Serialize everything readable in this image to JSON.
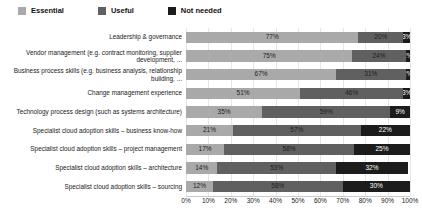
{
  "legend": {
    "items": [
      {
        "label": "Essential",
        "color": "#a9a9a9"
      },
      {
        "label": "Useful",
        "color": "#606060"
      },
      {
        "label": "Not needed",
        "color": "#1c1c1c"
      }
    ]
  },
  "axis": {
    "x_ticks": [
      "0%",
      "10%",
      "20%",
      "30%",
      "40%",
      "50%",
      "60%",
      "70%",
      "80%",
      "90%",
      "100%"
    ]
  },
  "chart_data": {
    "type": "bar",
    "orientation": "horizontal",
    "stacked": true,
    "stack_mode": "percent",
    "title": "",
    "xlabel": "",
    "ylabel": "",
    "xlim": [
      0,
      100
    ],
    "grid": true,
    "legend_position": "top-left",
    "categories": [
      "Leadership & governance",
      "Vendor management (e.g. contract monitoring, supplier development, ...",
      "Business process skills (e.g. business analysis, relationship building, ...",
      "Change management experience",
      "Technology process design (such as systems architecture)",
      "Specialist cloud adoption skills – business know-how",
      "Specialist cloud adoption skills – project management",
      "Specialist cloud adoption skills – architecture",
      "Specialist cloud adoption skills – sourcing"
    ],
    "series": [
      {
        "name": "Essential",
        "color": "#a9a9a9",
        "values": [
          77,
          75,
          67,
          51,
          35,
          21,
          17,
          14,
          12
        ]
      },
      {
        "name": "Useful",
        "color": "#606060",
        "values": [
          20,
          24,
          31,
          46,
          59,
          57,
          58,
          53,
          58
        ]
      },
      {
        "name": "Not needed",
        "color": "#1c1c1c",
        "values": [
          3,
          2,
          2,
          3,
          9,
          22,
          25,
          32,
          30
        ]
      }
    ],
    "data_labels": [
      [
        "77%",
        "20%",
        "3%"
      ],
      [
        "75%",
        "24%",
        "2%"
      ],
      [
        "67%",
        "31%",
        "2%"
      ],
      [
        "51%",
        "46%",
        "3%"
      ],
      [
        "35%",
        "59%",
        "9%"
      ],
      [
        "21%",
        "57%",
        "22%"
      ],
      [
        "17%",
        "58%",
        "25%"
      ],
      [
        "14%",
        "53%",
        "32%"
      ],
      [
        "12%",
        "58%",
        "30%"
      ]
    ]
  }
}
